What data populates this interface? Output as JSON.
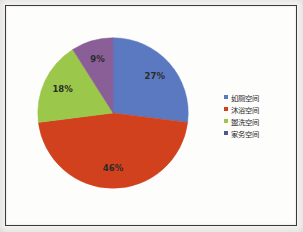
{
  "chart_data": {
    "type": "pie",
    "title": "",
    "subtitle": "",
    "xlabel": "",
    "ylabel": "",
    "grid": false,
    "legend_position": "right",
    "categories": [
      "如厕空间",
      "沐浴空间",
      "盥洗空间",
      "家务空间"
    ],
    "values": [
      27,
      46,
      18,
      9
    ],
    "value_unit": "%",
    "data_labels": [
      "27%",
      "46%",
      "18%",
      "9%"
    ],
    "colors": [
      "#5B79C0",
      "#D1411E",
      "#9BC74A",
      "#8A5E96"
    ],
    "start_angle_deg": 0,
    "direction": "clockwise",
    "slices": [
      {
        "label": "如厕空间",
        "value": 27,
        "data_label": "27%",
        "color": "#5B79C0"
      },
      {
        "label": "沐浴空间",
        "value": 46,
        "data_label": "46%",
        "color": "#D1411E"
      },
      {
        "label": "盥洗空间",
        "value": 18,
        "data_label": "18%",
        "color": "#9BC74A"
      },
      {
        "label": "家务空间",
        "value": 9,
        "data_label": "9%",
        "color": "#8A5E96"
      }
    ]
  },
  "legend": {
    "items": [
      {
        "label": "如厕空间",
        "color": "#5B79C0"
      },
      {
        "label": "沐浴空间",
        "color": "#D1411E"
      },
      {
        "label": "盥洗空间",
        "color": "#9BC74A"
      },
      {
        "label": "家务空间",
        "color": "#4A5B8C"
      }
    ]
  },
  "frame": {
    "border_color": "#3a3a3c",
    "background_color": "#fdfdfc"
  }
}
